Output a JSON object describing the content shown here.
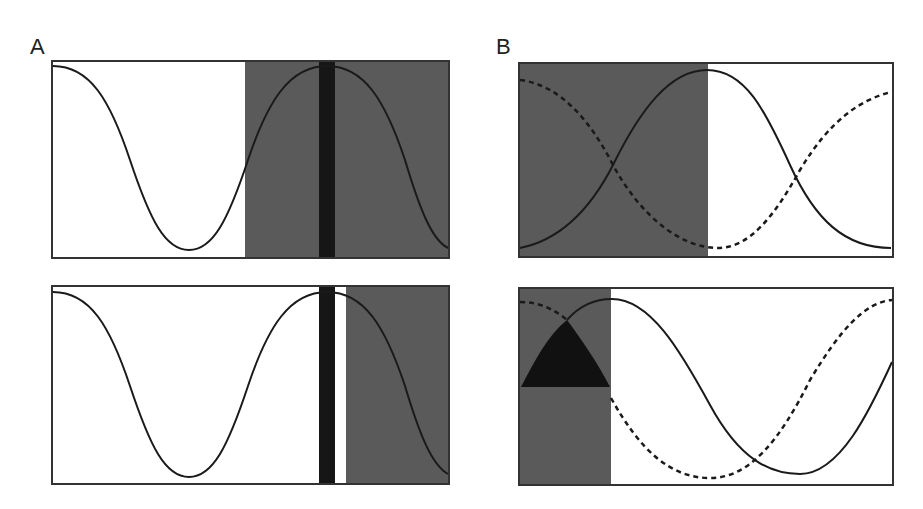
{
  "labels": {
    "panel_a": "A",
    "panel_b": "B"
  },
  "colors": {
    "background": "#ffffff",
    "frame": "#333333",
    "shaded_region": "#5a5a5a",
    "dark_bar": "#161616",
    "curve": "#1a1a1a"
  },
  "panels": [
    {
      "id": "A-top",
      "frame": {
        "x": 52,
        "y": 61,
        "w": 397,
        "h": 197
      },
      "shaded_regions": [
        {
          "x0": 245,
          "x1": 449
        }
      ],
      "dark_bars": [
        {
          "x0": 319,
          "x1": 335
        }
      ],
      "curves": [
        {
          "style": "solid",
          "description": "cosine starting at peak, trough near x=189, peak near x=327"
        }
      ]
    },
    {
      "id": "A-bottom",
      "frame": {
        "x": 52,
        "y": 286,
        "w": 397,
        "h": 198
      },
      "shaded_regions": [
        {
          "x0": 346,
          "x1": 449
        }
      ],
      "dark_bars": [
        {
          "x0": 319,
          "x1": 335
        }
      ],
      "curves": [
        {
          "style": "solid",
          "description": "same cosine as A-top"
        }
      ]
    },
    {
      "id": "B-top",
      "frame": {
        "x": 519,
        "y": 63,
        "w": 374,
        "h": 194
      },
      "shaded_regions": [
        {
          "x0": 519,
          "x1": 708
        }
      ],
      "curves": [
        {
          "style": "solid",
          "description": "rises from low to peak at x=707, falls back to low"
        },
        {
          "style": "dashed",
          "description": "falls from high to trough at x=720, rises again"
        }
      ]
    },
    {
      "id": "B-bottom",
      "frame": {
        "x": 519,
        "y": 288,
        "w": 374,
        "h": 197
      },
      "shaded_regions": [
        {
          "x0": 519,
          "x1": 611
        }
      ],
      "dark_region": {
        "shape": "curved-triangle",
        "apex": [
          567,
          320
        ],
        "base_y": 387,
        "x0": 521,
        "x1": 610
      },
      "curves": [
        {
          "style": "solid",
          "description": "peak at x=612, trough at x=800, rising at right edge"
        },
        {
          "style": "dashed",
          "description": "starts high, trough at x=710, rises to high at right edge"
        }
      ]
    }
  ]
}
